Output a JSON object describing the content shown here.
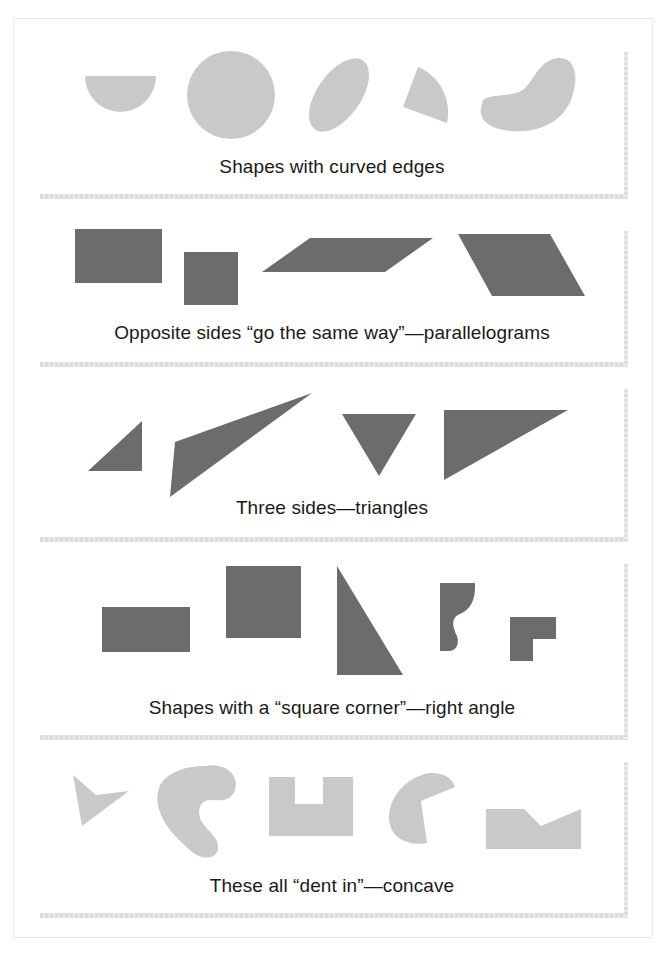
{
  "figure": {
    "colors": {
      "curved_and_concave_fill": "#c9c9c9",
      "polygon_fill": "#6c6c6c",
      "frame_border": "#e8e8e8"
    },
    "panels": [
      {
        "id": "curved",
        "caption": "Shapes with curved edges",
        "shapes": [
          "half-circle",
          "circle",
          "tilted-ellipse",
          "circle-sector",
          "bean"
        ]
      },
      {
        "id": "parallelograms",
        "caption": "Opposite sides “go the same way”—parallelograms",
        "shapes": [
          "rectangle",
          "square",
          "slanted-parallelogram",
          "rhombus-parallelogram"
        ]
      },
      {
        "id": "triangles",
        "caption": "Three sides—triangles",
        "shapes": [
          "right-triangle-small",
          "obtuse-triangle",
          "inverted-triangle",
          "right-triangle-large"
        ]
      },
      {
        "id": "right-angles",
        "caption": "Shapes with a “square corner”—right angle",
        "shapes": [
          "rectangle",
          "square",
          "right-triangle",
          "curvy-corner-shape",
          "l-shape"
        ]
      },
      {
        "id": "concave",
        "caption": "These all “dent in”—concave",
        "shapes": [
          "arrowhead",
          "kidney",
          "u-notch",
          "pac-man",
          "v-notch"
        ]
      }
    ]
  }
}
